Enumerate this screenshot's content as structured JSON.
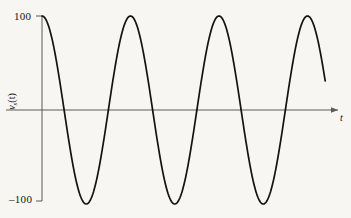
{
  "figure": {
    "background_color": "#f7f6f3",
    "curve_color": "#15120f",
    "axis_color": "#5a5a58"
  },
  "labels": {
    "y_max": "100",
    "y_min": "–100",
    "x_axis": "t",
    "y_axis_main": "v",
    "y_axis_sub": "s",
    "y_axis_arg": "(t)"
  },
  "chart_data": {
    "type": "line",
    "title": "",
    "xlabel": "t",
    "ylabel": "v_s(t)",
    "ylim": [
      -100,
      100
    ],
    "xlim": [
      0,
      3.2
    ],
    "grid": false,
    "legend": null,
    "yticks": [
      100,
      -100
    ],
    "ytick_labels": [
      "100",
      "–100"
    ],
    "xticks": [],
    "xtick_labels": [],
    "annotations": [],
    "series": [
      {
        "name": "v_s(t)",
        "waveform": "cosine",
        "amplitude": 100,
        "periods_shown": 3.2,
        "phase_deg": 0,
        "x": [
          0,
          0.1,
          0.2,
          0.3,
          0.4,
          0.5,
          0.6,
          0.7,
          0.8,
          0.9,
          1.0,
          1.1,
          1.2,
          1.3,
          1.4,
          1.5,
          1.6,
          1.7,
          1.8,
          1.9,
          2.0,
          2.1,
          2.2,
          2.3,
          2.4,
          2.5,
          2.6,
          2.7,
          2.8,
          2.9,
          3.0,
          3.1,
          3.2
        ],
        "values": [
          100,
          81,
          31,
          -31,
          -81,
          -100,
          -81,
          -31,
          31,
          81,
          100,
          81,
          31,
          -31,
          -81,
          -100,
          -81,
          -31,
          31,
          81,
          100,
          81,
          31,
          -31,
          -81,
          -100,
          -81,
          -31,
          31,
          81,
          100,
          81,
          31
        ]
      }
    ]
  }
}
